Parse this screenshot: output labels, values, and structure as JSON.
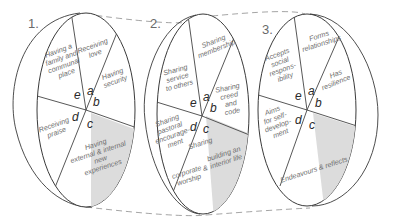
{
  "diagram": {
    "wheels": [
      {
        "number": "1.",
        "segments": {
          "a": {
            "letter": "a",
            "lines": [
              "Receiving",
              "love"
            ]
          },
          "b": {
            "letter": "b",
            "lines": [
              "Having",
              "security"
            ]
          },
          "c": {
            "letter": "c",
            "lines": [
              "Having",
              "external & internal",
              "new",
              "experiences"
            ]
          },
          "d": {
            "letter": "d",
            "lines": [
              "Receiving",
              "praise"
            ]
          },
          "e": {
            "letter": "e",
            "lines": [
              "Having a",
              "family and",
              "communal",
              "place"
            ]
          }
        }
      },
      {
        "number": "2.",
        "segments": {
          "a": {
            "letter": "a",
            "lines": [
              "Sharing",
              "membership"
            ]
          },
          "b": {
            "letter": "b",
            "lines": [
              "Sharing",
              "creed",
              "and",
              "code"
            ]
          },
          "c": {
            "letter": "c",
            "lines": [
              "Sharing",
              "corporate",
              "worship",
              "&",
              "building an",
              "interior life"
            ]
          },
          "d": {
            "letter": "d",
            "lines": [
              "Sharing",
              "pastoral",
              "encourage-",
              "ment"
            ]
          },
          "e": {
            "letter": "e",
            "lines": [
              "Sharing",
              "service",
              "to others"
            ]
          }
        }
      },
      {
        "number": "3.",
        "segments": {
          "a": {
            "letter": "a",
            "lines": [
              "Forms",
              "relationships"
            ]
          },
          "b": {
            "letter": "b",
            "lines": [
              "Has",
              "resilience"
            ]
          },
          "c": {
            "letter": "c",
            "lines": [
              "Endeavours & reflects"
            ]
          },
          "d": {
            "letter": "d",
            "lines": [
              "Aims",
              "for self-",
              "develop-",
              "ment"
            ]
          },
          "e": {
            "letter": "e",
            "lines": [
              "Accepts",
              "social",
              "respons-",
              "ibility"
            ]
          }
        }
      }
    ],
    "colors": {
      "shade": "#dcdcdc",
      "stroke": "#3a3a3a",
      "label": "#6e6e6e",
      "dash": "#9a9a9a"
    }
  }
}
